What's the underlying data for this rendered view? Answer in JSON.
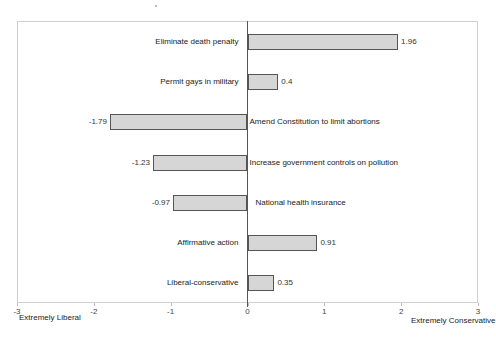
{
  "chart_data": {
    "type": "bar",
    "orientation": "horizontal",
    "title": "",
    "categories": [
      "Eliminate death penalty",
      "Permit gays in military",
      "Amend Constitution to limit abortions",
      "Increase government controls on pollution",
      "National health insurance",
      "Affirmative action",
      "Liberal-conservative"
    ],
    "values": [
      1.96,
      0.4,
      -1.79,
      -1.23,
      -0.97,
      0.91,
      0.35
    ],
    "value_labels": [
      "1.96",
      "0.4",
      "-1.79",
      "-1.23",
      "-0.97",
      "0.91",
      "0.35"
    ],
    "xlabel": "",
    "ylabel": "",
    "xlim": [
      -3,
      3
    ],
    "x_ticks": [
      "-3",
      "-2",
      "-1",
      "0",
      "1",
      "2",
      "3"
    ],
    "axis_end_labels": {
      "left": "Extremely Liberal",
      "right": "Extremely Conservative"
    },
    "grid": false,
    "legend": null,
    "colors": {
      "bar_fill": "#d6d6d6",
      "bar_border": "#555555",
      "frame": "#d0d0d0"
    }
  }
}
